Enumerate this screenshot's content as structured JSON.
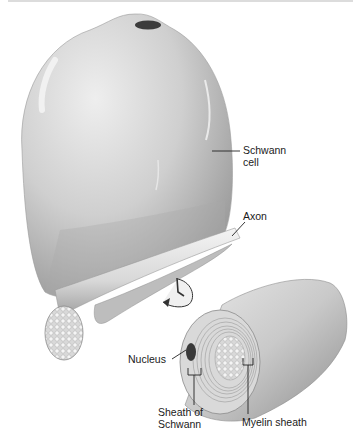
{
  "diagram": {
    "labels": {
      "schwann_cell": "Schwann\ncell",
      "schwann_line1": "Schwann",
      "schwann_line2": "cell",
      "axon": "Axon",
      "nucleus": "Nucleus",
      "sheath_line1": "Sheath of",
      "sheath_line2": "Schwann",
      "myelin_sheath": "Myelin sheath"
    },
    "parts": [
      "Schwann cell body (flattened sheet)",
      "Axon with cut end showing neurofibrils",
      "Curved rotation arrow indicating wrapping",
      "Myelinated axon cross-section",
      "Nucleus",
      "Sheath of Schwann",
      "Myelin sheath (concentric layers)"
    ],
    "colors": {
      "background": "#ffffff",
      "cell_fill": "#d4d4d4",
      "cell_shadow": "#a8a8a8",
      "highlight": "#f2f2f2",
      "nucleus": "#3a3a3a",
      "text": "#1a1a1a",
      "leader_line": "#222222"
    }
  }
}
